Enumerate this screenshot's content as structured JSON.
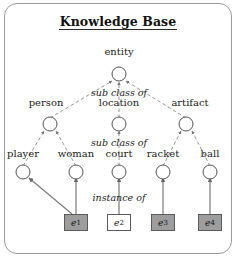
{
  "figure": {
    "title": "Knowledge Base",
    "background_color": "#ffffff",
    "frame_color": "#9a9a9a",
    "node_stroke_color": "#555555",
    "edge_color": "#777777"
  },
  "nodes": {
    "root": {
      "label": "entity",
      "x": 119,
      "y": 74,
      "label_x": 119,
      "label_y": 53
    },
    "level2": [
      {
        "id": "person",
        "label": "person",
        "x": 50,
        "y": 124,
        "label_x": 46,
        "label_y": 104
      },
      {
        "id": "location",
        "label": "location",
        "x": 119,
        "y": 124,
        "label_x": 119,
        "label_y": 104
      },
      {
        "id": "artifact",
        "label": "artifact",
        "x": 186,
        "y": 124,
        "label_x": 190,
        "label_y": 104
      }
    ],
    "level3": [
      {
        "id": "player",
        "label": "player",
        "x": 23,
        "y": 172,
        "label_x": 23,
        "label_y": 155
      },
      {
        "id": "woman",
        "label": "woman",
        "x": 76,
        "y": 172,
        "label_x": 76,
        "label_y": 155
      },
      {
        "id": "court",
        "label": "court",
        "x": 119,
        "y": 172,
        "label_x": 119,
        "label_y": 155
      },
      {
        "id": "racket",
        "label": "racket",
        "x": 163,
        "y": 172,
        "label_x": 163,
        "label_y": 155
      },
      {
        "id": "ball",
        "label": "ball",
        "x": 210,
        "y": 172,
        "label_x": 210,
        "label_y": 155
      }
    ],
    "instances": [
      {
        "id": "e1",
        "label": "e",
        "subscript": "1",
        "x": 76,
        "y": 222,
        "fill": "#9d9d9d",
        "shaded": true
      },
      {
        "id": "e2",
        "label": "e",
        "subscript": "2",
        "x": 119,
        "y": 222,
        "fill": "#ffffff",
        "shaded": false
      },
      {
        "id": "e3",
        "label": "e",
        "subscript": "3",
        "x": 163,
        "y": 222,
        "fill": "#9d9d9d",
        "shaded": true
      },
      {
        "id": "e4",
        "label": "e",
        "subscript": "4",
        "x": 210,
        "y": 222,
        "fill": "#9d9d9d",
        "shaded": true
      }
    ]
  },
  "edge_labels": [
    {
      "id": "sub-class-of-upper",
      "text": "sub class of",
      "x": 119,
      "y": 94
    },
    {
      "id": "sub-class-of-lower",
      "text": "sub class of",
      "x": 119,
      "y": 144
    },
    {
      "id": "instance-of",
      "text": "instance of",
      "x": 119,
      "y": 199
    }
  ],
  "edges": {
    "dashed_from_level2_to_root": [
      {
        "from": "person",
        "to": "entity"
      },
      {
        "from": "location",
        "to": "entity"
      },
      {
        "from": "artifact",
        "to": "entity"
      }
    ],
    "dashed_from_level3_to_level2": [
      {
        "from": "player",
        "to": "person"
      },
      {
        "from": "woman",
        "to": "person"
      },
      {
        "from": "court",
        "to": "location"
      },
      {
        "from": "racket",
        "to": "artifact"
      },
      {
        "from": "ball",
        "to": "artifact"
      }
    ],
    "solid_from_instance_to_class": [
      {
        "from": "e1",
        "to": "player"
      },
      {
        "from": "e1",
        "to": "woman"
      },
      {
        "from": "e2",
        "to": "court"
      },
      {
        "from": "e3",
        "to": "racket"
      },
      {
        "from": "e4",
        "to": "ball"
      }
    ]
  }
}
